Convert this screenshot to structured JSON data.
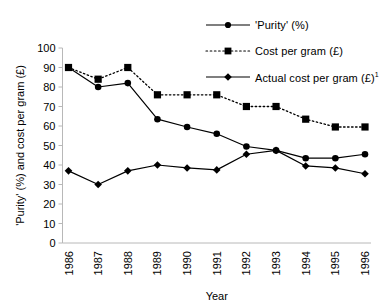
{
  "chart_data": {
    "type": "line",
    "title": "",
    "xlabel": "Year",
    "ylabel": "'Purity' (%) and cost per gram (£)",
    "categories": [
      "1986",
      "1987",
      "1988",
      "1989",
      "1990",
      "1991",
      "1992",
      "1993",
      "1994",
      "1995",
      "1996"
    ],
    "ylim": [
      0,
      100
    ],
    "yticks": [
      0,
      10,
      20,
      30,
      40,
      50,
      60,
      70,
      80,
      90,
      100
    ],
    "grid": false,
    "legend_position": "top-right",
    "series": [
      {
        "name": "'Purity' (%)",
        "marker": "circle",
        "line": "solid",
        "color": "#000000",
        "values": [
          90,
          80,
          82,
          63.5,
          59.5,
          56,
          49.5,
          47.5,
          43.5,
          43.5,
          45.5
        ]
      },
      {
        "name": "Cost per gram (£)",
        "marker": "square",
        "line": "dotted",
        "color": "#000000",
        "values": [
          90,
          84,
          90,
          76,
          76,
          76,
          70,
          70,
          63.5,
          59.5,
          59.5
        ]
      },
      {
        "name": "Actual cost per gram (£)",
        "name_superscript": "1",
        "marker": "diamond",
        "line": "solid",
        "color": "#000000",
        "values": [
          37,
          30,
          37,
          40,
          38.5,
          37.5,
          45.5,
          47.5,
          39.5,
          38.5,
          35.5
        ]
      }
    ]
  },
  "legend": {
    "items": [
      {
        "label": "'Purity' (%)",
        "sup": ""
      },
      {
        "label": "Cost per gram (£)",
        "sup": ""
      },
      {
        "label": "Actual cost per gram (£)",
        "sup": "1"
      }
    ]
  },
  "axes": {
    "y_title": "'Purity' (%) and cost per gram (£)",
    "x_title": "Year",
    "y_ticks": [
      "100",
      "90",
      "80",
      "70",
      "60",
      "50",
      "40",
      "30",
      "20",
      "10",
      "0"
    ],
    "x_ticks": [
      "1986",
      "1987",
      "1988",
      "1989",
      "1990",
      "1991",
      "1992",
      "1993",
      "1994",
      "1995",
      "1996"
    ]
  },
  "colors": {
    "ink": "#000000",
    "axis": "#b8b8b8",
    "background": "#ffffff"
  }
}
